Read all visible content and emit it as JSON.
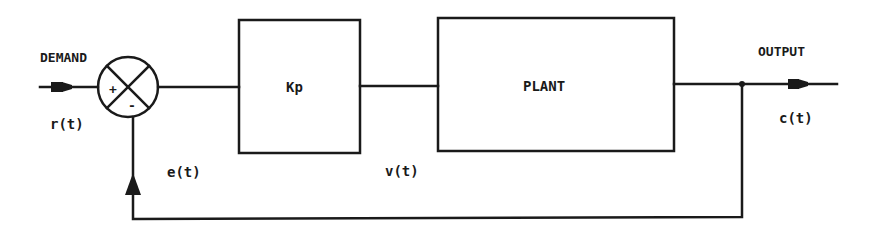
{
  "diagram": {
    "type": "closed-loop control block diagram",
    "input": {
      "label": "DEMAND",
      "signal": "r(t)"
    },
    "summing_junction": {
      "plus_sign": "+",
      "minus_sign": "-"
    },
    "blocks": [
      {
        "id": "controller",
        "label": "Kp"
      },
      {
        "id": "plant",
        "label": "PLANT"
      }
    ],
    "signals": {
      "error": "e(t)",
      "control": "v(t)"
    },
    "output": {
      "label": "OUTPUT",
      "signal": "c(t)"
    },
    "colors": {
      "ink": "#1a1a1a",
      "background": "#ffffff"
    }
  }
}
